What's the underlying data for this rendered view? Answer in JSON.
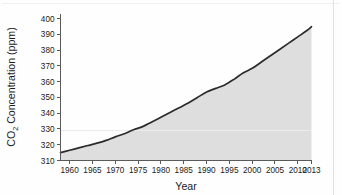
{
  "figure": {
    "background_color": "#fefefe",
    "area_fill_color": "#dedede",
    "line_color": "#2b2b2b",
    "axis_color": "#5a5a5a"
  },
  "axes": {
    "y_title_main": "CO",
    "y_title_sub": "2",
    "y_title_rest": " Concentration (ppm)",
    "y_title_full": "CO2 Concentration (ppm)",
    "x_title": "Year",
    "y_ticks": [
      "310",
      "320",
      "330",
      "340",
      "350",
      "360",
      "370",
      "380",
      "390",
      "400"
    ],
    "x_ticks": [
      "1960",
      "1965",
      "1970",
      "1975",
      "1980",
      "1985",
      "1990",
      "1995",
      "2000",
      "2005",
      "2010",
      "2013"
    ]
  },
  "chart_data": {
    "type": "area",
    "title": "",
    "subtitle": "",
    "xlabel": "Year",
    "ylabel": "CO2 Concentration (ppm)",
    "xlim": [
      1958,
      2013
    ],
    "ylim": [
      310,
      403
    ],
    "grid": false,
    "legend": null,
    "xtick_values": [
      1960,
      1965,
      1970,
      1975,
      1980,
      1985,
      1990,
      1995,
      2000,
      2005,
      2010,
      2013
    ],
    "ytick_values": [
      310,
      320,
      330,
      340,
      350,
      360,
      370,
      380,
      390,
      400
    ],
    "series": [
      {
        "name": "CO2 Concentration (ppm)",
        "x": [
          1958,
          1960,
          1962,
          1964,
          1966,
          1968,
          1970,
          1972,
          1974,
          1976,
          1978,
          1980,
          1982,
          1984,
          1986,
          1988,
          1990,
          1992,
          1994,
          1996,
          1998,
          2000,
          2002,
          2004,
          2006,
          2008,
          2010,
          2012,
          2013
        ],
        "values": [
          315.0,
          316.5,
          318.0,
          319.5,
          321.0,
          322.8,
          325.0,
          327.0,
          329.5,
          331.5,
          334.5,
          337.5,
          340.5,
          343.5,
          346.5,
          350.0,
          353.5,
          355.8,
          358.0,
          361.5,
          365.5,
          368.5,
          372.5,
          376.5,
          380.5,
          384.5,
          388.5,
          392.5,
          395.0
        ]
      }
    ],
    "annotations": []
  }
}
